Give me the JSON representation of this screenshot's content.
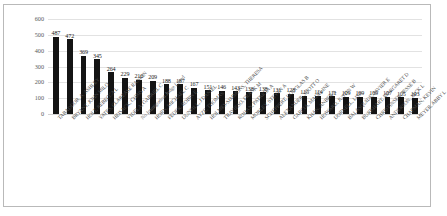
{
  "chart_data": {
    "type": "bar",
    "title": "",
    "subtitle": "",
    "xlabel": "",
    "ylabel": "",
    "ylim": [
      0,
      600
    ],
    "yticks": [
      0,
      100,
      200,
      300,
      400,
      500,
      600
    ],
    "grid": true,
    "legend": false,
    "legend_position": "none",
    "bar_color": "#141414",
    "gridline_color": "#e2e2e2",
    "axis_text_color": "#58595b",
    "label_rotation": -45,
    "data_labels_shown": true,
    "categories": [
      "TABADDOR, A. ASHLEY",
      "BRYANT, JOHN MILO",
      "HOLT, REBECCA L",
      "YATES, CLAREASE RANKIN",
      "HEISACK, CHRIS A",
      "VIDELA, GABRIEL C",
      "No Immigration Judge Listed",
      "HORN, MICHAEL C",
      "FEDER, ROBIN E",
      "DUNFILL, J DANIEL",
      "AYZE, THOMAS",
      "HOLMES-SIMMONS, THERESA",
      "TRAVIESO, FRANK M",
      "ROHAN, PATRICIA A",
      "MORLEY, STEVEN A",
      "SCHEPPERT, DOUGLAS B",
      "ALEXANDER, SCOTT O",
      "GARCIA, MADELINE",
      "KHAN, ANBER A",
      "HOWARD, JUSTIN W",
      "DORNELL, LISA",
      "BALASQUIDE, JAVIER E",
      "BURKHART, MARGARET D",
      "CHRISTINSEN, JESSE B",
      "ANDERSON, JACK L",
      "CHAPMAN, KEVIN",
      "MEYER, ABBY L"
    ],
    "values": [
      487,
      472,
      369,
      345,
      264,
      229,
      216,
      209,
      188,
      187,
      167,
      151,
      146,
      143,
      138,
      138,
      131,
      128,
      115,
      114,
      111,
      109,
      109,
      109,
      107,
      105,
      103
    ]
  }
}
